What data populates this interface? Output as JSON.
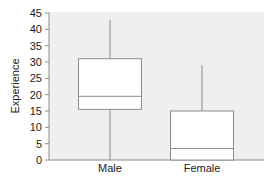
{
  "chart_data": {
    "type": "box",
    "title": "",
    "xlabel": "",
    "ylabel": "Experience",
    "ylim": [
      0,
      45
    ],
    "yticks": [
      0,
      5,
      10,
      15,
      20,
      25,
      30,
      35,
      40,
      45
    ],
    "grid": false,
    "legend": null,
    "categories": [
      "Male",
      "Female"
    ],
    "boxes": [
      {
        "category": "Male",
        "whisker_low": 0,
        "q1": 15.5,
        "median": 19.5,
        "q3": 31,
        "whisker_high": 43
      },
      {
        "category": "Female",
        "whisker_low": 0,
        "q1": 0,
        "median": 3.5,
        "q3": 15,
        "whisker_high": 29
      }
    ],
    "colors": {
      "plot_background": "#efefef",
      "box_fill": "#ffffff",
      "box_stroke": "#8c8c8c",
      "axis": "#8c8c8c"
    }
  }
}
